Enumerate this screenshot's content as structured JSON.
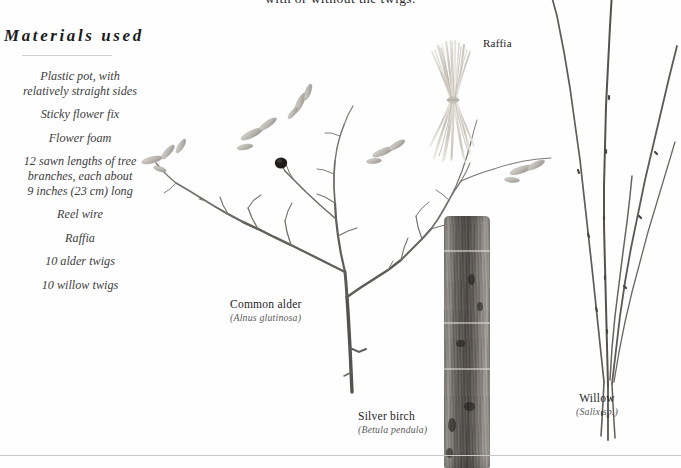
{
  "page": {
    "background_color": "#fefefe",
    "running_text": "with or without the twigs.",
    "rule_color": "#c8c8c8"
  },
  "materials": {
    "heading": "Materials used",
    "items": [
      "Plastic pot, with\nrelatively straight sides",
      "Sticky flower fix",
      "Flower foam",
      "12 sawn lengths of tree\nbranches, each about\n9 inches (23 cm) long",
      "Reel wire",
      "Raffia",
      "10 alder twigs",
      "10 willow twigs"
    ]
  },
  "specimens": [
    {
      "id": "alder",
      "common_name": "Common alder",
      "latin_name": "(Alnus glutinosa)"
    },
    {
      "id": "birch",
      "common_name": "Silver birch",
      "latin_name": "(Betula pendula)"
    },
    {
      "id": "willow",
      "common_name": "Willow",
      "latin_name": "(Salix sp.)"
    },
    {
      "id": "raffia",
      "common_name": "Raffia",
      "latin_name": ""
    }
  ],
  "colors": {
    "text_dark": "#1c1c1c",
    "text_italic": "#3d3d3d",
    "latin_gray": "#5b5b5b",
    "twig_gray": "#6f6a66",
    "bark_dark": "#4e4a47",
    "raffia_pale": "#d8d4cb"
  }
}
